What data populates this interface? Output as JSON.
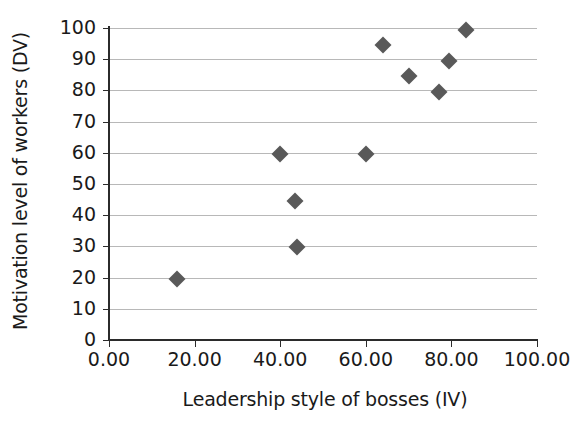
{
  "chart_data": {
    "type": "scatter",
    "title": "",
    "xlabel": "Leadership style of bosses (IV)",
    "ylabel": "Motivation level of workers  (DV)",
    "xlim": [
      0,
      100
    ],
    "ylim": [
      0,
      100
    ],
    "xticks": [
      0,
      20,
      40,
      60,
      80,
      100
    ],
    "xtick_labels": [
      "0.00",
      "20.00",
      "40.00",
      "60.00",
      "80.00",
      "100.00"
    ],
    "yticks": [
      0,
      10,
      20,
      30,
      40,
      50,
      60,
      70,
      80,
      90,
      100
    ],
    "ytick_labels": [
      "0",
      "10",
      "20",
      "30",
      "40",
      "50",
      "60",
      "70",
      "80",
      "90",
      "100"
    ],
    "grid": "horizontal",
    "legend": "none",
    "marker": "diamond",
    "marker_color": "#595959",
    "points": [
      {
        "x": 16.0,
        "y": 19.7
      },
      {
        "x": 40.0,
        "y": 59.7
      },
      {
        "x": 43.5,
        "y": 44.5
      },
      {
        "x": 44.0,
        "y": 29.7
      },
      {
        "x": 60.0,
        "y": 59.7
      },
      {
        "x": 64.0,
        "y": 94.5
      },
      {
        "x": 70.0,
        "y": 84.5
      },
      {
        "x": 77.0,
        "y": 79.5
      },
      {
        "x": 79.5,
        "y": 89.5
      },
      {
        "x": 83.5,
        "y": 99.5
      }
    ]
  },
  "colors": {
    "marker": "#595959",
    "gridline": "#b8b8b8",
    "axis": "#2b2b2b",
    "background": "#ffffff",
    "text": "#1a1a1a"
  }
}
